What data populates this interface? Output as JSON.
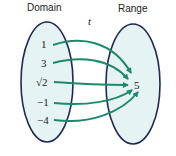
{
  "diagram": {
    "domain_label": "Domain",
    "range_label": "Range",
    "function_name": "t",
    "domain_values": [
      "1",
      "3",
      "√2",
      "−1",
      "−4"
    ],
    "range_values": [
      "5"
    ],
    "mappings": [
      {
        "from": "1",
        "to": "5"
      },
      {
        "from": "3",
        "to": "5"
      },
      {
        "from": "√2",
        "to": "5"
      },
      {
        "from": "−1",
        "to": "5"
      },
      {
        "from": "−4",
        "to": "5"
      }
    ],
    "colors": {
      "ellipse_fill": "#e6f3f3",
      "ellipse_stroke": "#1f2a5a",
      "arrow": "#1a8a6a"
    }
  }
}
